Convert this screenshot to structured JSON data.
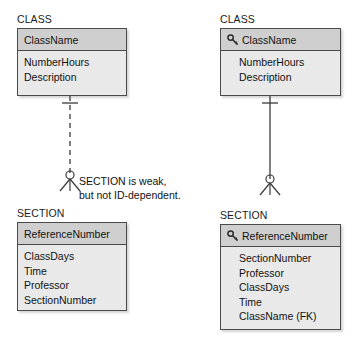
{
  "diagram": {
    "title_left": "CLASS",
    "title_right": "CLASS",
    "colors": {
      "header_fill": "#cfcfcf",
      "body_fill": "#e9e9e9",
      "border": "#4a4a4a",
      "text": "#121212",
      "line": "#3a3a3a"
    }
  },
  "left_model": {
    "class_entity": {
      "label": "CLASS",
      "identifier": "ClassName",
      "attributes": [
        "NumberHours",
        "Description"
      ],
      "has_key_icon": false
    },
    "section_entity": {
      "label": "SECTION",
      "identifier": "ReferenceNumber",
      "attributes": [
        "ClassDays",
        "Time",
        "Professor",
        "SectionNumber"
      ],
      "has_key_icon": false
    },
    "relationship": {
      "line_style": "dashed",
      "parent_cardinality": "one",
      "child_cardinality": "optional-many"
    }
  },
  "right_model": {
    "class_entity": {
      "label": "CLASS",
      "identifier": "ClassName",
      "attributes": [
        "NumberHours",
        "Description"
      ],
      "has_key_icon": true
    },
    "section_entity": {
      "label": "SECTION",
      "identifier": "ReferenceNumber",
      "attributes": [
        "SectionNumber",
        "Professor",
        "ClassDays",
        "Time",
        "ClassName (FK)"
      ],
      "has_key_icon": true
    },
    "relationship": {
      "line_style": "solid",
      "parent_cardinality": "one",
      "child_cardinality": "optional-many"
    }
  },
  "annotation": {
    "line1": "SECTION is weak,",
    "line2": "but not ID-dependent."
  }
}
